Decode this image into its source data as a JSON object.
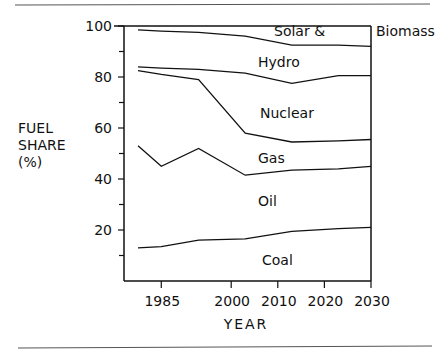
{
  "chart_data": {
    "type": "area",
    "title": "",
    "xlabel": "YEAR",
    "ylabel": "FUEL SHARE (%)",
    "ylabel_lines": [
      "FUEL",
      "SHARE",
      "(%)"
    ],
    "xlim": [
      1977,
      2030
    ],
    "ylim": [
      0,
      100
    ],
    "xticks": [
      1985,
      2000,
      2010,
      2020,
      2030
    ],
    "yticks": [
      20,
      40,
      60,
      80,
      100
    ],
    "ytick_minor": [
      10,
      30,
      50,
      70,
      90
    ],
    "x": [
      1980,
      1985,
      1993,
      2003,
      2013,
      2023,
      2030
    ],
    "boundaries": [
      {
        "name": "Coal/Oil",
        "values": [
          13,
          13.5,
          16,
          16.5,
          19.5,
          20.5,
          21
        ]
      },
      {
        "name": "Oil/Gas",
        "values": [
          53,
          45,
          52,
          41.5,
          43.5,
          44,
          45
        ]
      },
      {
        "name": "Gas/Nuclear",
        "values": [
          82.5,
          81,
          79,
          58,
          54.5,
          55,
          55.5
        ]
      },
      {
        "name": "Nuclear/Hydro",
        "values": [
          84,
          83.5,
          83,
          81.5,
          77.5,
          80.5,
          80.5
        ]
      },
      {
        "name": "Hydro/Solar & Biomass",
        "values": [
          98.5,
          98,
          97.5,
          96,
          92.5,
          92.5,
          92
        ]
      }
    ],
    "band_labels": [
      "Coal",
      "Oil",
      "Gas",
      "Nuclear",
      "Hydro",
      "Solar &",
      "Biomass"
    ],
    "grid": false,
    "legend": "inline labels"
  }
}
